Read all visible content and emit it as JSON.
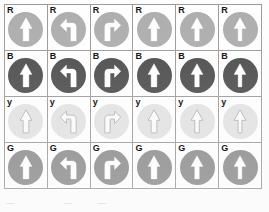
{
  "figure": {
    "title": "",
    "grid": {
      "rows": 4,
      "columns": 6,
      "border_color": "#9a9a9a",
      "background": "#ffffff"
    },
    "row_labels": [
      "R",
      "B",
      "y",
      "G"
    ],
    "row_names": [
      "red",
      "blue",
      "yellow",
      "green"
    ],
    "column_arrow_types": [
      "arrow-up",
      "arrow-turn-left",
      "arrow-turn-right",
      "arrow-up",
      "arrow-up",
      "arrow-up"
    ],
    "rows": [
      {
        "label": "R",
        "name": "red",
        "disc_color": "#adadad",
        "arrow_color": "#ffffff",
        "arrow_stroke": "#ffffff",
        "arrow_filled": true,
        "cells": [
          {
            "arrow": "arrow-up",
            "arrow_width": "wide"
          },
          {
            "arrow": "arrow-turn-left",
            "arrow_width": "wide"
          },
          {
            "arrow": "arrow-turn-right",
            "arrow_width": "wide"
          },
          {
            "arrow": "arrow-up",
            "arrow_width": "wide"
          },
          {
            "arrow": "arrow-up",
            "arrow_width": "medium"
          },
          {
            "arrow": "arrow-up",
            "arrow_width": "narrow"
          }
        ]
      },
      {
        "label": "B",
        "name": "blue",
        "disc_color": "#4c4c4c",
        "arrow_color": "#ffffff",
        "arrow_stroke": "#ffffff",
        "arrow_filled": true,
        "cells": [
          {
            "arrow": "arrow-up",
            "arrow_width": "wide"
          },
          {
            "arrow": "arrow-turn-left",
            "arrow_width": "wide"
          },
          {
            "arrow": "arrow-turn-right",
            "arrow_width": "wide"
          },
          {
            "arrow": "arrow-up",
            "arrow_width": "wide"
          },
          {
            "arrow": "arrow-up",
            "arrow_width": "medium"
          },
          {
            "arrow": "arrow-up",
            "arrow_width": "narrow"
          }
        ]
      },
      {
        "label": "y",
        "name": "yellow",
        "disc_color": "#e2e2e2",
        "arrow_color": "#fbfbfb",
        "arrow_stroke": "#b5b5b5",
        "arrow_filled": false,
        "cells": [
          {
            "arrow": "arrow-up",
            "arrow_width": "wide"
          },
          {
            "arrow": "arrow-turn-left",
            "arrow_width": "wide"
          },
          {
            "arrow": "arrow-turn-right",
            "arrow_width": "wide"
          },
          {
            "arrow": "arrow-up",
            "arrow_width": "wide"
          },
          {
            "arrow": "arrow-up",
            "arrow_width": "medium"
          },
          {
            "arrow": "arrow-up",
            "arrow_width": "narrow"
          }
        ]
      },
      {
        "label": "G",
        "name": "green",
        "disc_color": "#8a8a8a",
        "arrow_color": "#ffffff",
        "arrow_stroke": "#ffffff",
        "arrow_filled": true,
        "cells": [
          {
            "arrow": "arrow-up",
            "arrow_width": "wide"
          },
          {
            "arrow": "arrow-turn-left",
            "arrow_width": "wide"
          },
          {
            "arrow": "arrow-turn-right",
            "arrow_width": "wide"
          },
          {
            "arrow": "arrow-up",
            "arrow_width": "wide"
          },
          {
            "arrow": "arrow-up",
            "arrow_width": "medium"
          },
          {
            "arrow": "arrow-up",
            "arrow_width": "narrow"
          }
        ]
      }
    ]
  },
  "caption": {
    "fragments": [
      "—",
      "—",
      "—"
    ]
  }
}
